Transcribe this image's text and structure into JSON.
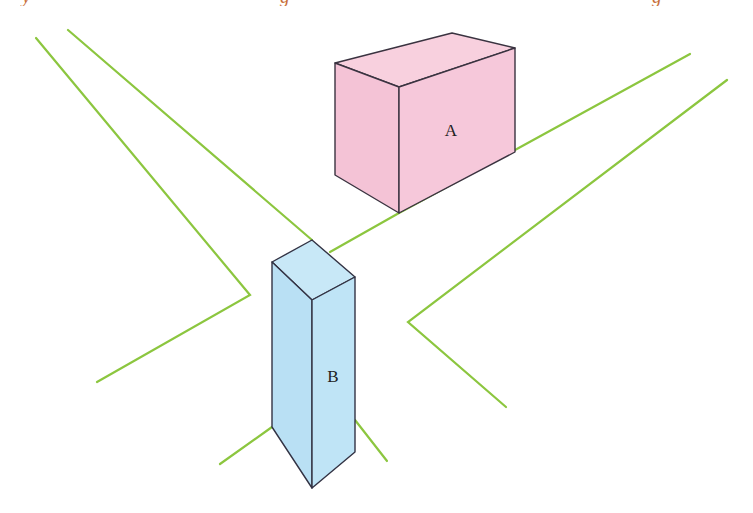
{
  "header": {
    "clipped_caption_descenders": "y g g"
  },
  "diagram": {
    "colors": {
      "road_line": "#8cc63f",
      "box_a_fill": "#f6c6d8",
      "box_a_top": "#f8d0de",
      "box_b_fill": "#bde3f5",
      "box_b_top": "#c8e8f7",
      "outline": "#333344"
    },
    "objects": [
      {
        "id": "A",
        "label": "A",
        "shape": "rectangular box",
        "color": "pink"
      },
      {
        "id": "B",
        "label": "B",
        "shape": "tall rectangular prism",
        "color": "light-blue"
      }
    ]
  }
}
